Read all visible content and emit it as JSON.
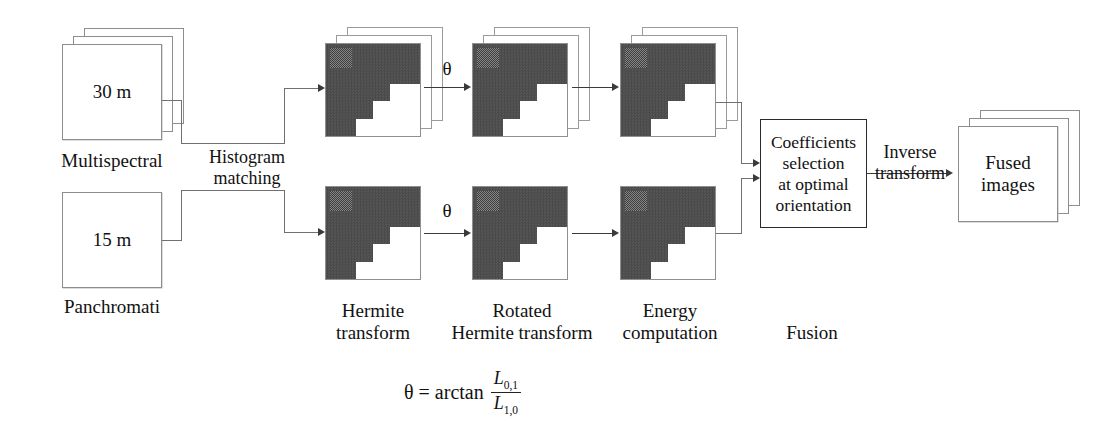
{
  "diagram": {
    "type": "flowchart"
  },
  "inputs": {
    "multispectral": {
      "value_label": "30 m",
      "caption": "Multispectral",
      "stack_layers": 3
    },
    "panchromatic": {
      "value_label": "15 m",
      "caption": "Panchromati",
      "stack_layers": 1
    }
  },
  "edges": {
    "histogram_matching": "Histogram\nmatching",
    "inverse_transform": "Inverse\ntransform",
    "theta_top": "θ",
    "theta_bottom": "θ"
  },
  "stages": {
    "hermite_transform": {
      "caption": "Hermite\ntransform"
    },
    "rotated_hermite_transform": {
      "caption": "Rotated\nHermite transform"
    },
    "energy_computation": {
      "caption": "Energy\ncomputation"
    },
    "fusion": {
      "caption": "Fusion"
    }
  },
  "fusion_box": {
    "text": "Coefficients\nselection\nat optimal\norientation"
  },
  "output": {
    "fused_images": {
      "text": "Fused\nimages",
      "stack_layers": 3
    }
  },
  "formula": {
    "lhs": "θ = arctan",
    "numerator": "L",
    "numerator_sub": "0,1",
    "denominator": "L",
    "denominator_sub": "1,0"
  },
  "colors": {
    "background": "#ffffff",
    "line": "#707070",
    "arrow": "#3a3a3a",
    "box_border": "#8d8d8d",
    "process_border": "#2b2b2b",
    "tile_dark": "#4e4e4e",
    "text": "#1a1a1a"
  }
}
